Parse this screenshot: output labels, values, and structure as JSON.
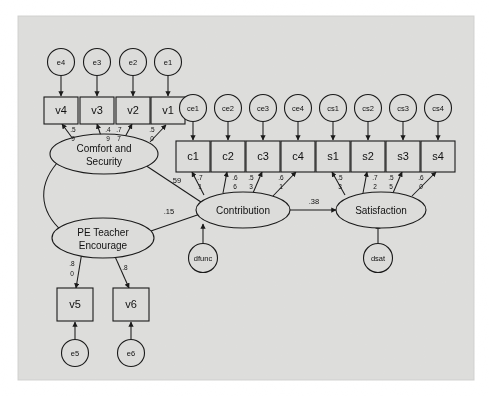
{
  "figure": {
    "type": "sem-path-diagram",
    "background_color": "#ffffff",
    "canvas_color": "#e3e3e1",
    "node_fill": "#dcdcda",
    "stroke_color": "#1a1a1a"
  },
  "latent_variables": [
    {
      "id": "comfort",
      "label_line1": "Comfort and",
      "label_line2": "Security"
    },
    {
      "id": "pe",
      "label_line1": "PE Teacher",
      "label_line2": "Encourage"
    },
    {
      "id": "contribution",
      "label_line1": "Contribution",
      "label_line2": ""
    },
    {
      "id": "satisfaction",
      "label_line1": "Satisfaction",
      "label_line2": ""
    }
  ],
  "observed_variables": [
    {
      "id": "v4",
      "label": "v4"
    },
    {
      "id": "v3",
      "label": "v3"
    },
    {
      "id": "v2",
      "label": "v2"
    },
    {
      "id": "v1",
      "label": "v1"
    },
    {
      "id": "c1",
      "label": "c1"
    },
    {
      "id": "c2",
      "label": "c2"
    },
    {
      "id": "c3",
      "label": "c3"
    },
    {
      "id": "c4",
      "label": "c4"
    },
    {
      "id": "s1",
      "label": "s1"
    },
    {
      "id": "s2",
      "label": "s2"
    },
    {
      "id": "s3",
      "label": "s3"
    },
    {
      "id": "s4",
      "label": "s4"
    },
    {
      "id": "v5",
      "label": "v5"
    },
    {
      "id": "v6",
      "label": "v6"
    }
  ],
  "error_terms": [
    {
      "id": "e4",
      "label": "e4"
    },
    {
      "id": "e3",
      "label": "e3"
    },
    {
      "id": "e2",
      "label": "e2"
    },
    {
      "id": "e1",
      "label": "e1"
    },
    {
      "id": "ce1",
      "label": "ce1"
    },
    {
      "id": "ce2",
      "label": "ce2"
    },
    {
      "id": "ce3",
      "label": "ce3"
    },
    {
      "id": "ce4",
      "label": "ce4"
    },
    {
      "id": "cs1",
      "label": "cs1"
    },
    {
      "id": "cs2",
      "label": "cs2"
    },
    {
      "id": "cs3",
      "label": "cs3"
    },
    {
      "id": "cs4",
      "label": "cs4"
    },
    {
      "id": "e5",
      "label": "e5"
    },
    {
      "id": "e6",
      "label": "e6"
    }
  ],
  "disturbances": [
    {
      "id": "dfunc",
      "label": "dfunc"
    },
    {
      "id": "dsat",
      "label": "dsat"
    }
  ],
  "loadings": [
    {
      "from": "comfort",
      "to": "v4",
      "top": ".5",
      "bottom": "9",
      "value": ".59"
    },
    {
      "from": "comfort",
      "to": "v3",
      "top": ".4",
      "bottom": "9",
      "value": ".49"
    },
    {
      "from": "comfort",
      "to": "v2",
      "top": ".7",
      "bottom": "7",
      "value": ".77"
    },
    {
      "from": "comfort",
      "to": "v1",
      "top": ".5",
      "bottom": "0",
      "value": ".50"
    },
    {
      "from": "contribution",
      "to": "c1",
      "top": ".7",
      "bottom": "1",
      "value": ".71"
    },
    {
      "from": "contribution",
      "to": "c2",
      "top": ".6",
      "bottom": "6",
      "value": ".66"
    },
    {
      "from": "contribution",
      "to": "c3",
      "top": ".5",
      "bottom": "3",
      "value": ".53"
    },
    {
      "from": "contribution",
      "to": "c4",
      "top": ".6",
      "bottom": "1",
      "value": ".61"
    },
    {
      "from": "satisfaction",
      "to": "s1",
      "top": ".5",
      "bottom": "3",
      "value": ".53"
    },
    {
      "from": "satisfaction",
      "to": "s2",
      "top": ".7",
      "bottom": "2",
      "value": ".72"
    },
    {
      "from": "satisfaction",
      "to": "s3",
      "top": ".5",
      "bottom": "5",
      "value": ".55"
    },
    {
      "from": "satisfaction",
      "to": "s4",
      "top": ".6",
      "bottom": "0",
      "value": ".60"
    },
    {
      "from": "pe",
      "to": "v5",
      "top": ".8",
      "bottom": "0",
      "value": ".80"
    },
    {
      "from": "pe",
      "to": "v6",
      "top": ".8",
      "bottom": "",
      "value": ".8"
    }
  ],
  "structural_paths": [
    {
      "from": "comfort",
      "to": "contribution",
      "label": ".59"
    },
    {
      "from": "pe",
      "to": "contribution",
      "label": ".15"
    },
    {
      "from": "contribution",
      "to": "satisfaction",
      "label": ".38"
    }
  ],
  "covariances": [
    {
      "between": "comfort",
      "and": "pe",
      "label": ""
    }
  ]
}
